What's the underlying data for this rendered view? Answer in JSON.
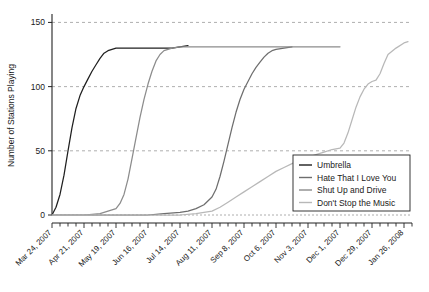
{
  "chart_data": {
    "type": "line",
    "title": "",
    "xlabel": "",
    "ylabel": "Number of Stations Playing",
    "ylim": [
      0,
      155
    ],
    "yticks": [
      0,
      50,
      100,
      150
    ],
    "ytick_labels": [
      "0",
      "50",
      "100",
      "150"
    ],
    "grid": true,
    "grid_axis": "y",
    "legend_position": "lower-right",
    "x_tick_labels": [
      "Mar 24, 2007",
      "Apr 21, 2007",
      "May 19, 2007",
      "Jun 16, 2007",
      "Jul 14, 2007",
      "Aug 11, 2007",
      "Sep 8, 2007",
      "Oct 6, 2007",
      "Nov 3, 2007",
      "Dec 1, 2007",
      "Dec 29, 2007",
      "Jan 26, 2008"
    ],
    "x_tick_weeks": [
      0,
      4,
      8,
      12,
      16,
      20,
      24,
      28,
      32,
      36,
      40,
      44
    ],
    "x_minor_tick_interval_weeks": 1,
    "x_range_weeks": [
      0,
      45
    ],
    "series": [
      {
        "name": "Umbrella",
        "color": "#1f1f1f",
        "x_weeks": [
          0,
          0.5,
          1,
          1.5,
          2,
          2.5,
          3,
          3.5,
          4,
          4.5,
          5,
          5.5,
          6,
          6.5,
          7,
          7.5,
          8,
          9,
          10,
          11,
          12,
          13,
          14,
          15,
          16,
          17
        ],
        "values": [
          0,
          6,
          16,
          31,
          50,
          68,
          83,
          93,
          100,
          106,
          112,
          117,
          122,
          126,
          128,
          129,
          130,
          130,
          130,
          130,
          130,
          130,
          130,
          130,
          131,
          132
        ]
      },
      {
        "name": "Hate That I Love You",
        "color": "#6e6e6e",
        "x_weeks": [
          0,
          4,
          8,
          12,
          14,
          16,
          17,
          18,
          19,
          20,
          20.5,
          21,
          21.5,
          22,
          22.5,
          23,
          23.5,
          24,
          24.5,
          25,
          25.5,
          26,
          26.5,
          27,
          27.5,
          28,
          29,
          30
        ],
        "values": [
          0,
          0,
          0,
          0,
          1,
          2,
          3,
          5,
          8,
          14,
          20,
          30,
          42,
          55,
          68,
          80,
          90,
          98,
          104,
          110,
          115,
          119,
          123,
          126,
          128,
          129,
          130,
          131
        ]
      },
      {
        "name": "Shut Up and Drive",
        "color": "#8c8c8c",
        "x_weeks": [
          0,
          2,
          4,
          6,
          7,
          8,
          8.5,
          9,
          9.5,
          10,
          10.5,
          11,
          11.5,
          12,
          12.5,
          13,
          13.5,
          14,
          15,
          16,
          17,
          18,
          19,
          20,
          22,
          24,
          26,
          28,
          30,
          32,
          34,
          36
        ],
        "values": [
          0,
          0,
          0,
          1,
          3,
          5,
          9,
          16,
          28,
          44,
          60,
          76,
          90,
          102,
          112,
          120,
          125,
          128,
          130,
          131,
          131,
          131,
          131,
          131,
          131,
          131,
          131,
          131,
          131,
          131,
          131,
          131
        ]
      },
      {
        "name": "Don't Stop the Music",
        "color": "#b8b8b8",
        "x_weeks": [
          0,
          8,
          12,
          16,
          18,
          20,
          21,
          22,
          23,
          24,
          25,
          26,
          27,
          28,
          29,
          30,
          31,
          32,
          33,
          34,
          35,
          36,
          36.5,
          37,
          37.5,
          38,
          38.5,
          39,
          39.5,
          40,
          40.5,
          41,
          41.5,
          42,
          43,
          44,
          44.5
        ],
        "values": [
          0,
          0,
          0,
          0,
          1,
          3,
          6,
          10,
          14,
          18,
          22,
          26,
          30,
          34,
          37,
          40,
          43,
          45,
          47,
          49,
          51,
          52,
          56,
          64,
          74,
          84,
          92,
          98,
          102,
          104,
          105,
          110,
          118,
          125,
          130,
          134,
          135
        ]
      }
    ]
  },
  "legend": {
    "entries": [
      {
        "label": "Umbrella"
      },
      {
        "label": "Hate That I Love You"
      },
      {
        "label": "Shut Up and Drive"
      },
      {
        "label": "Don't Stop the Music"
      }
    ]
  }
}
